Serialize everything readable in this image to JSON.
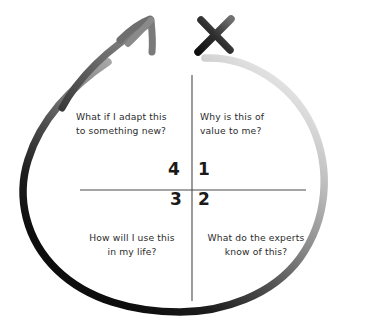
{
  "diagram": {
    "background_color": "#ffffff",
    "axis_color": "#4a4a4a",
    "text_color": "#2b2b2b",
    "loop_dark_color": "#111111",
    "loop_light_color": "#e6e6e6",
    "arrow_color": "#6e6e6e",
    "x_mark_color": "#1a1a1a"
  },
  "quadrants": [
    {
      "id": "q1",
      "number": "1",
      "position": "top-right",
      "text": "Why is this of\nvalue to me?"
    },
    {
      "id": "q2",
      "number": "2",
      "position": "bottom-right",
      "text": "What do the experts\nknow of this?"
    },
    {
      "id": "q3",
      "number": "3",
      "position": "bottom-left",
      "text": "How will I use this\nin my life?"
    },
    {
      "id": "q4",
      "number": "4",
      "position": "top-left",
      "text": "What if I adapt this\nto something new?"
    }
  ],
  "annotations": {
    "arrow": "arrow-up-right",
    "x_mark": "x-mark",
    "loop": "encircling-loop"
  }
}
